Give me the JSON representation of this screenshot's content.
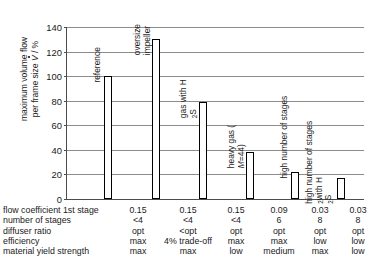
{
  "chart_data": {
    "type": "bar",
    "title": "",
    "xlabel": "",
    "ylabel_line1": "maximum volume flow",
    "ylabel_line2_pre": "per frame size ",
    "ylabel_line2_var": "V",
    "ylabel_line2_post": " / %",
    "ylim": [
      0,
      140
    ],
    "ytick_labels": [
      "0",
      "20",
      "40",
      "60",
      "80",
      "100",
      "120",
      "140"
    ],
    "ytick_values": [
      0,
      20,
      40,
      60,
      80,
      100,
      120,
      140
    ],
    "grid": true,
    "legend": "none",
    "categories": [
      "reference",
      "oversize impeller",
      "gas with H2S",
      "heavy gas (M=44)",
      "high number of stages",
      "high number of stages with H2S"
    ],
    "values": [
      100,
      130,
      79,
      38,
      22,
      17
    ],
    "bar_captions": [
      {
        "lines": [
          "reference"
        ],
        "sub": null
      },
      {
        "lines": [
          "oversize",
          "impeller"
        ],
        "sub": null
      },
      {
        "lines": [
          "gas with H",
          "S"
        ],
        "sub": "2"
      },
      {
        "lines": [
          "heavy gas (",
          "=44)"
        ],
        "sub": "M"
      },
      {
        "lines": [
          "high number of stages"
        ],
        "sub": null
      },
      {
        "lines": [
          "high number of stages",
          "with H",
          "S"
        ],
        "sub": "2"
      }
    ]
  },
  "table": {
    "row_labels": [
      "flow coefficient 1st stage",
      "number of stages",
      "diffuser ratio",
      "efficiency",
      "material yield strength"
    ],
    "rows": [
      [
        "0.15",
        "0.15",
        "0.15",
        "0.09",
        "0.03",
        "0.03"
      ],
      [
        "<4",
        "<4",
        "<4",
        "6",
        "8",
        "8"
      ],
      [
        "opt",
        "<opt",
        "opt",
        "opt",
        "opt",
        "opt"
      ],
      [
        "max",
        "4% trade-off",
        "max",
        "max",
        "low",
        "low"
      ],
      [
        "max",
        "max",
        "low",
        "medium",
        "max",
        "low"
      ]
    ]
  },
  "colors": {
    "bar_outline": "#000000",
    "bar_fill": "#ffffff",
    "gridline": "#8c8c8c",
    "axis": "#4d4d4d",
    "text": "#1a1a1a",
    "background": "#ffffff"
  }
}
